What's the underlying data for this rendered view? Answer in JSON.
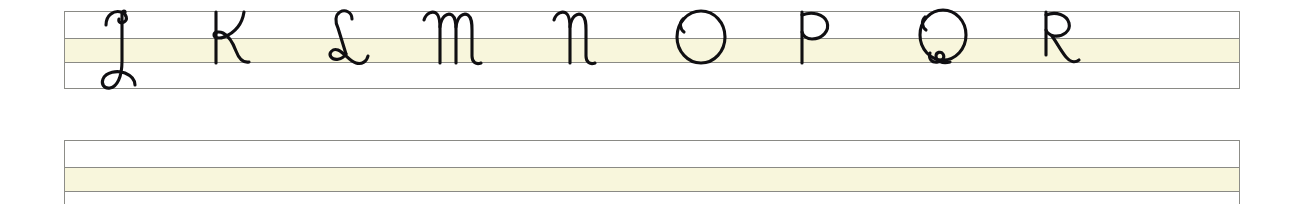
{
  "document": {
    "type": "handwriting-practice-worksheet",
    "script_style": "cursive",
    "letter_case": "uppercase",
    "title": "",
    "background_color": "#ffffff",
    "rule_color": "#8a8a85",
    "xheight_band_color": "#f8f6dc",
    "ink_color": "#100f12"
  },
  "staves": [
    {
      "name": "stave-row-1",
      "filled": true,
      "rules": [
        "ascender",
        "midline",
        "baseline",
        "descender"
      ],
      "letters": [
        {
          "char": "J",
          "x": 76,
          "descender": true,
          "name": "letter-j"
        },
        {
          "char": "K",
          "x": 186,
          "descender": false,
          "name": "letter-k"
        },
        {
          "char": "L",
          "x": 296,
          "descender": false,
          "name": "letter-l"
        },
        {
          "char": "M",
          "x": 406,
          "descender": false,
          "name": "letter-m"
        },
        {
          "char": "N",
          "x": 524,
          "descender": false,
          "name": "letter-n"
        },
        {
          "char": "O",
          "x": 650,
          "descender": false,
          "name": "letter-o"
        },
        {
          "char": "P",
          "x": 770,
          "descender": false,
          "name": "letter-p"
        },
        {
          "char": "Q",
          "x": 890,
          "descender": false,
          "name": "letter-q"
        },
        {
          "char": "R",
          "x": 1014,
          "descender": false,
          "name": "letter-r"
        }
      ]
    },
    {
      "name": "stave-row-2",
      "filled": false,
      "rules": [
        "ascender",
        "midline",
        "baseline",
        "descender"
      ],
      "letters": []
    }
  ],
  "sequence": {
    "letters_shown": "J K L M N O P Q R",
    "count": 9,
    "first": "J",
    "last": "R"
  }
}
